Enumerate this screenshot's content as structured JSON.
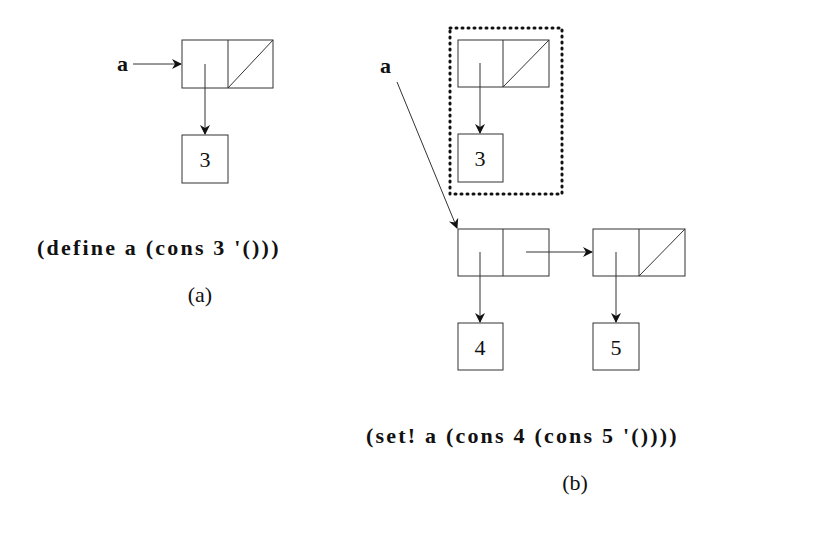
{
  "diagram": {
    "panel_a": {
      "variable": "a",
      "car_value": "3",
      "code": "(define a (cons 3 '()))",
      "caption": "(a)"
    },
    "panel_b": {
      "variable": "a",
      "garbage_car_value": "3",
      "cell1_car_value": "4",
      "cell2_car_value": "5",
      "code": "(set! a (cons 4 (cons 5 '())))",
      "caption": "(b)"
    }
  }
}
